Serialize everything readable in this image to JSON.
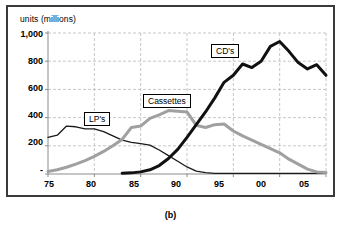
{
  "figure": {
    "caption": "(b)",
    "axis_title": "units (millions)"
  },
  "callouts": {
    "lp": "LP's",
    "cassettes": "Cassettes",
    "cds": "CD's"
  },
  "colors": {
    "lp_line": "#1a1a1a",
    "cassettes_line": "#a0a0a0",
    "cds_line": "#111111",
    "grid": "#b9b9b9",
    "axis": "#8c8c8c",
    "frame": "#3a3a3a",
    "background": "#ffffff"
  },
  "chart_data": {
    "type": "line",
    "title": "",
    "subtitle": "",
    "xlabel": "",
    "ylabel": "units (millions)",
    "ylim": [
      0,
      1000
    ],
    "xlim": [
      75,
      105
    ],
    "grid": true,
    "legend": "inline-callout-boxes",
    "ytick_labels": [
      "-",
      "200",
      "400",
      "600",
      "800",
      "1,000"
    ],
    "ytick_values": [
      0,
      200,
      400,
      600,
      800,
      1000
    ],
    "xtick_labels": [
      "75",
      "80",
      "85",
      "90",
      "95",
      "00",
      "05"
    ],
    "xtick_values": [
      75,
      80,
      85,
      90,
      95,
      100,
      105
    ],
    "x": [
      75,
      76,
      77,
      78,
      79,
      80,
      81,
      82,
      83,
      84,
      85,
      86,
      87,
      88,
      89,
      90,
      91,
      92,
      93,
      94,
      95,
      96,
      97,
      98,
      99,
      100,
      101,
      102,
      103,
      104,
      105
    ],
    "series": [
      {
        "name": "LP's",
        "values": [
          260,
          275,
          340,
          335,
          320,
          320,
          300,
          270,
          240,
          225,
          215,
          205,
          170,
          130,
          90,
          50,
          20,
          10,
          5,
          5,
          5,
          5,
          5,
          5,
          5,
          5,
          5,
          5,
          5,
          5,
          5
        ]
      },
      {
        "name": "Cassettes",
        "values": [
          18,
          30,
          48,
          70,
          95,
          125,
          160,
          200,
          245,
          330,
          340,
          395,
          420,
          450,
          445,
          440,
          345,
          330,
          350,
          355,
          305,
          270,
          240,
          210,
          180,
          150,
          105,
          70,
          35,
          15,
          10
        ]
      },
      {
        "name": "CD's",
        "values": [
          null,
          null,
          null,
          null,
          null,
          null,
          null,
          null,
          5,
          8,
          15,
          30,
          60,
          110,
          175,
          260,
          350,
          440,
          540,
          650,
          700,
          780,
          755,
          800,
          905,
          940,
          870,
          790,
          745,
          775,
          700
        ]
      }
    ]
  }
}
